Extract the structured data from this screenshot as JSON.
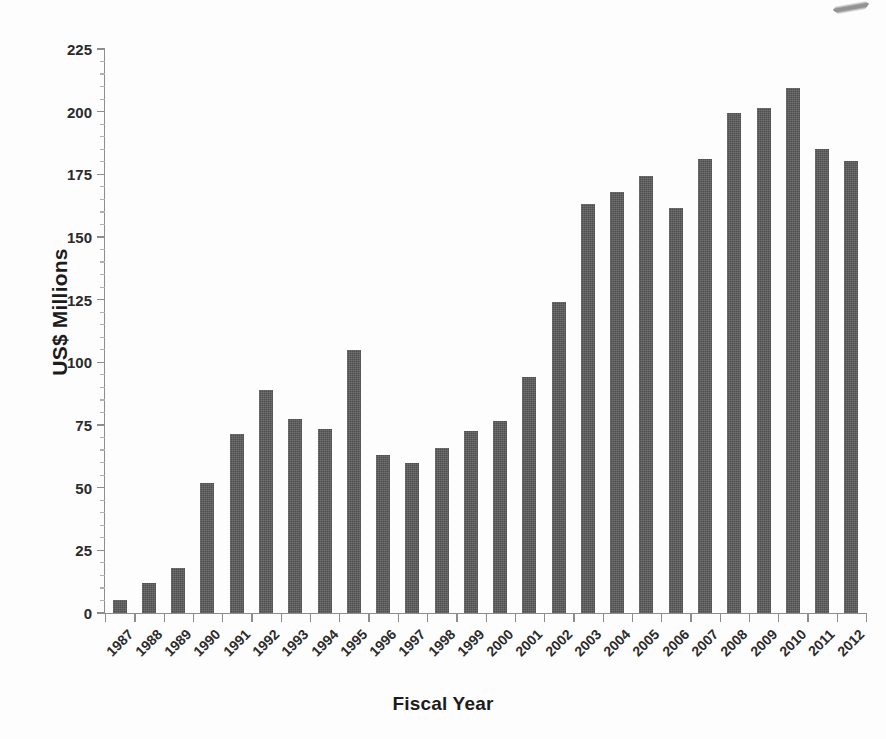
{
  "chart_data": {
    "type": "bar",
    "title": "",
    "xlabel": "Fiscal Year",
    "ylabel": "US$ Millions",
    "categories": [
      "1987",
      "1988",
      "1989",
      "1990",
      "1991",
      "1992",
      "1993",
      "1994",
      "1995",
      "1996",
      "1997",
      "1998",
      "1999",
      "2000",
      "2001",
      "2002",
      "2003",
      "2004",
      "2005",
      "2006",
      "2007",
      "2008",
      "2009",
      "2010",
      "2011",
      "2012"
    ],
    "values": [
      5,
      12,
      18,
      52,
      71.5,
      89,
      77.5,
      73.5,
      105,
      63,
      60,
      66,
      72.5,
      76.5,
      94,
      124,
      163,
      168,
      174.5,
      161.5,
      181,
      199.5,
      201.5,
      209.5,
      185,
      180.5
    ],
    "ylim": [
      0,
      225
    ],
    "ytick_labels": [
      "0",
      "25",
      "50",
      "75",
      "100",
      "125",
      "150",
      "175",
      "200",
      "225"
    ],
    "ytick_values": [
      0,
      25,
      50,
      75,
      100,
      125,
      150,
      175,
      200,
      225
    ],
    "ytick_step": 25,
    "minor_tick_step": 5,
    "grid": false,
    "legend": null,
    "bar_color": "#4f4f4f",
    "axis_color": "#8d8d8d",
    "text_color": "#2b2b2b",
    "background": "#ffffff",
    "xtick_rotation_degrees": -45,
    "series_count": 1
  },
  "axes": {
    "y_title": "US$ Millions",
    "x_title": "Fiscal Year"
  },
  "artifact": {
    "name": "scan-artifact"
  }
}
